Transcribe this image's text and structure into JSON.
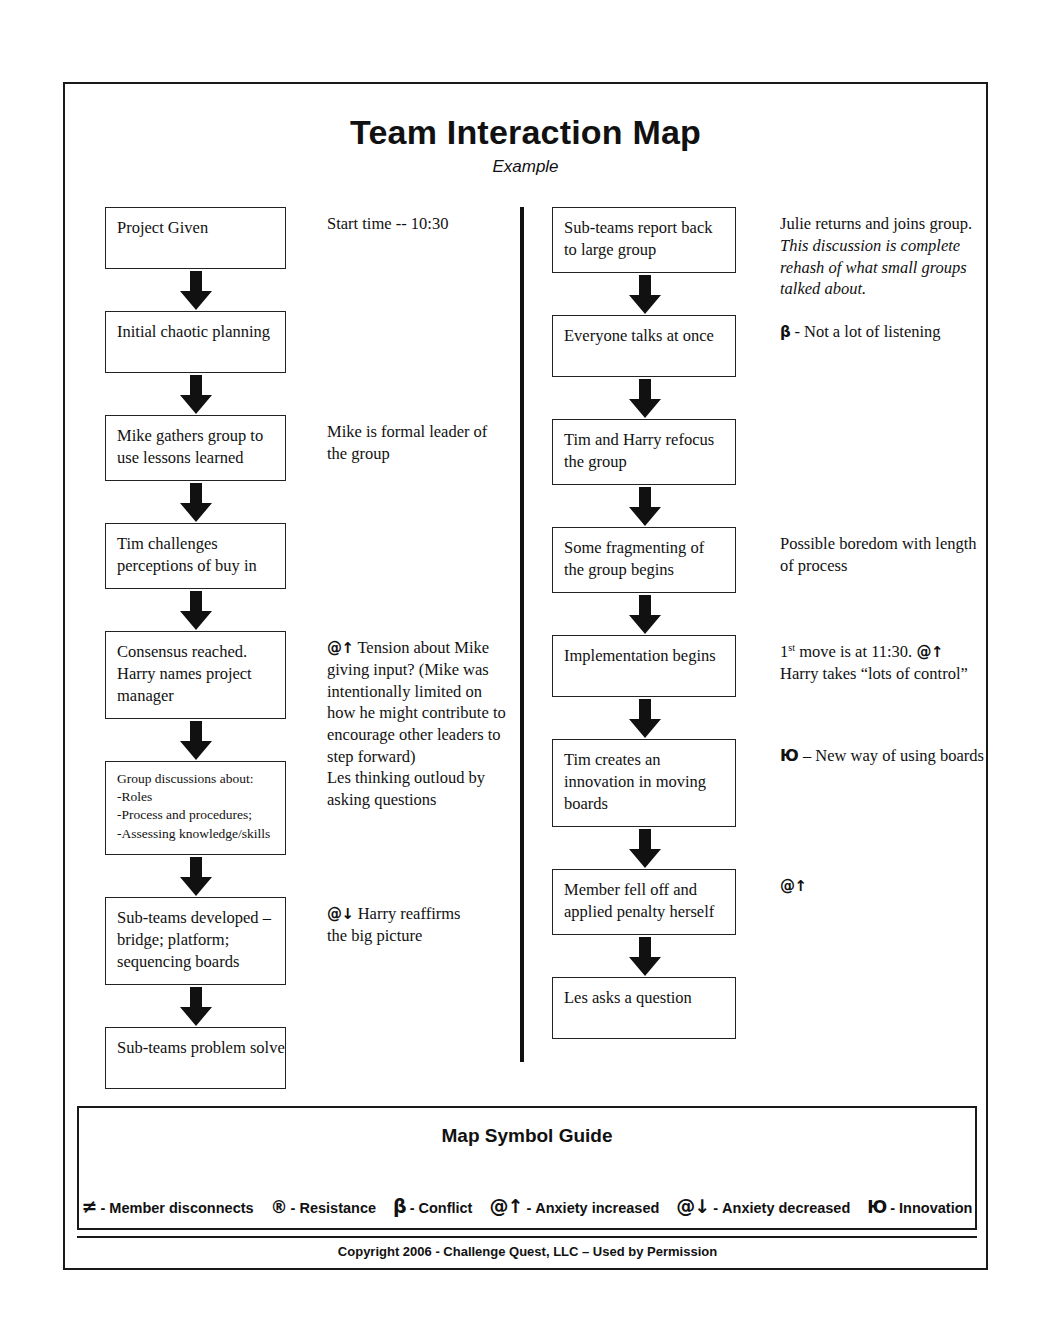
{
  "header": {
    "title": "Team Interaction Map",
    "subtitle": "Example"
  },
  "left_column": [
    {
      "box_lines": [
        "Project Given"
      ],
      "annotation_lines": [
        "Start time -- 10:30"
      ]
    },
    {
      "box_lines": [
        "Initial chaotic planning"
      ],
      "annotation_lines": []
    },
    {
      "box_lines": [
        "Mike gathers group to",
        "use lessons learned"
      ],
      "annotation_lines": [
        "Mike is formal leader of",
        "the group"
      ]
    },
    {
      "box_lines": [
        "Tim challenges",
        "perceptions of buy in"
      ],
      "annotation_lines": []
    },
    {
      "box_lines": [
        "Consensus reached.",
        "Harry names project",
        "manager"
      ],
      "annotation_symbol": "@↑",
      "annotation_lines": [
        " Tension about Mike",
        "giving input? (Mike was",
        "intentionally limited on",
        "how he might contribute to",
        "encourage other leaders to",
        "step forward)"
      ]
    },
    {
      "box_lines": [
        "Group discussions about:",
        "-Roles",
        "-Process and procedures;",
        "-Assessing knowledge/skills"
      ],
      "compact": true,
      "annotation_lines": [
        "Les thinking outloud by",
        "asking questions"
      ]
    },
    {
      "box_lines": [
        "Sub-teams developed –",
        "bridge; platform;",
        "sequencing boards"
      ],
      "annotation_symbol": "@↓",
      "annotation_lines": [
        " Harry reaffirms",
        "the big picture"
      ]
    },
    {
      "box_lines": [
        "Sub-teams problem solve"
      ],
      "annotation_lines": []
    }
  ],
  "right_column": [
    {
      "box_lines": [
        "Sub-teams report back",
        "to large group"
      ],
      "annotation_lines": [
        "Julie returns and joins group."
      ],
      "annotation_italic_lines": [
        "This discussion is complete",
        "rehash of what small groups",
        "talked about."
      ]
    },
    {
      "box_lines": [
        "Everyone talks at once"
      ],
      "annotation_symbol": "β",
      "annotation_lines": [
        " - Not a lot of listening"
      ]
    },
    {
      "box_lines": [
        "Tim and Harry refocus",
        "the group"
      ],
      "annotation_lines": []
    },
    {
      "box_lines": [
        "Some fragmenting of",
        "the group begins"
      ],
      "annotation_lines": [
        "Possible boredom with length",
        "of process"
      ]
    },
    {
      "box_lines": [
        "Implementation begins"
      ],
      "annotation_rich": {
        "prefix": "1",
        "sup": "st",
        "mid": " move is at 11:30.  ",
        "symbol": "@↑",
        "second_line": "Harry takes “lots of control”"
      },
      "annotation_lines": []
    },
    {
      "box_lines": [
        "Tim creates an",
        "innovation in moving",
        "boards"
      ],
      "annotation_symbol": "Ю",
      "annotation_lines": [
        " – New way of using boards"
      ]
    },
    {
      "box_lines": [
        "Member fell off and",
        "applied penalty herself"
      ],
      "annotation_symbol": "@↑",
      "annotation_lines": []
    },
    {
      "box_lines": [
        "Les asks a question"
      ],
      "annotation_lines": []
    }
  ],
  "legend": {
    "title": "Map Symbol Guide",
    "items": [
      {
        "glyph": "≠",
        "separator": "-",
        "label": "Member disconnects"
      },
      {
        "glyph": "®",
        "separator": "-",
        "label": "Resistance"
      },
      {
        "glyph": "β",
        "separator": "-",
        "label": "Conflict"
      },
      {
        "glyph": "@↑",
        "separator": "-",
        "label": "Anxiety increased"
      },
      {
        "glyph": "@↓",
        "separator": "-",
        "label": "Anxiety decreased"
      },
      {
        "glyph": "Ю",
        "separator": "-",
        "label": "Innovation"
      }
    ]
  },
  "footer": {
    "copyright": "Copyright 2006 - Challenge Quest, LLC – Used by Permission"
  }
}
